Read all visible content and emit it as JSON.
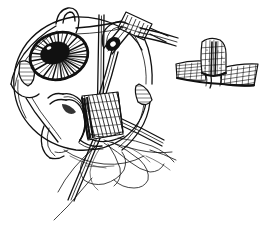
{
  "figure": {
    "title": "Strabismus surgery: extraocular muscle disinsertion and suture placement",
    "background_color": "#ffffff",
    "ink_color": "#111111",
    "width": 266,
    "height": 227,
    "style": "black-and-white pen-and-ink line drawing with crosshatch shading",
    "has_text_labels": false,
    "label_text": ""
  },
  "main_view": {
    "name": "primary-surgical-field",
    "description": "Anterior view of a globe held open by a lid speculum, with a rectus muscle elevated on a hook and grasped by a needle holder; double-armed suture trailing below.",
    "parts": [
      {
        "id": "eyelid-speculum",
        "label": "Eyelid speculum",
        "description": "Wire lid retractor framing the exposed globe, blades at upper, left and right",
        "interactable": false
      },
      {
        "id": "globe",
        "label": "Globe (eyeball)",
        "description": "Large rounded sclera outline occupying the left-centre of the field",
        "interactable": false
      },
      {
        "id": "cornea-iris",
        "label": "Cornea and iris",
        "description": "Oval iris with dense radial striations, solid black pupil at centre",
        "pupil_fill": "#111111",
        "interactable": false
      },
      {
        "id": "rectus-muscle",
        "label": "Rectus muscle belly",
        "description": "Crosshatched muscle tissue lifted off the sclera at the insertion",
        "interactable": false
      },
      {
        "id": "muscle-hook",
        "label": "Muscle hook",
        "description": "Curved hook passing beneath the muscle belly to elevate it",
        "interactable": false
      },
      {
        "id": "needle-holder",
        "label": "Needle holder / locking forceps",
        "description": "Ringed locking instrument entering from upper right with serrated cross-hatched jaws and a dark box-lock joint",
        "interactable": false
      },
      {
        "id": "instrument-shaft",
        "label": "Vertical instrument shaft",
        "description": "Straight vertical shaft descending through the centre into the muscle insertion",
        "interactable": false
      },
      {
        "id": "suture-threads",
        "label": "Suture threads",
        "description": "Fine looping double-armed suture strands trailing down and to the right below the muscle",
        "interactable": false
      }
    ]
  },
  "inset_view": {
    "name": "inset-detail",
    "description": "Magnified cross-section detail at upper right: the disinserted muscle stump standing upright on a flattened, hatched strip of sclera/conjunctiva.",
    "parts": [
      {
        "id": "muscle-stump",
        "label": "Disinserted muscle stump",
        "description": "Upright rounded tissue block with fine stipple and hatch shading",
        "interactable": false
      },
      {
        "id": "tissue-bed",
        "label": "Flattened tissue bed",
        "description": "Horizontal hatched band spreading to both sides beneath the stump",
        "interactable": false
      },
      {
        "id": "leader-lines",
        "label": "Leader lines",
        "description": "Two short parallel strokes at upper left of the inset pointing back toward the main view",
        "interactable": false
      }
    ]
  }
}
